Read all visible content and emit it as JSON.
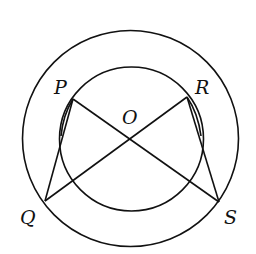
{
  "figure": {
    "type": "concentric-circles-geometry",
    "points": {
      "P": "P",
      "Q": "Q",
      "R": "R",
      "S": "S",
      "O": "O"
    },
    "segments": [
      "PS",
      "RQ",
      "PQ",
      "RS"
    ],
    "circles": [
      "inner",
      "outer"
    ],
    "stroke_color": "#111111",
    "background_color": "#ffffff"
  }
}
